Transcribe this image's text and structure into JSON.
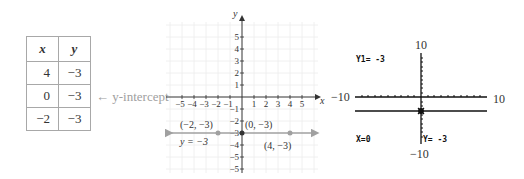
{
  "table": {
    "headers": [
      "x",
      "y"
    ],
    "rows": [
      {
        "x": "4",
        "y": "−3"
      },
      {
        "x": "0",
        "y": "−3"
      },
      {
        "x": "−2",
        "y": "−3"
      }
    ],
    "annotation": "← y-intercept"
  },
  "graph": {
    "x_axis_label": "x",
    "y_axis_label": "y",
    "x_ticks": [
      "−5",
      "−4",
      "−3",
      "−2",
      "−1",
      "1",
      "2",
      "3",
      "4",
      "5"
    ],
    "y_ticks": [
      "5",
      "4",
      "3",
      "2",
      "1",
      "−1",
      "−2",
      "−3",
      "−4",
      "−5"
    ],
    "line_label": "y = −3",
    "points": [
      {
        "label": "(−2, −3)",
        "x": -2,
        "y": -3
      },
      {
        "label": "(0, −3)",
        "x": 0,
        "y": -3
      },
      {
        "label": "(4, −3)",
        "x": 4,
        "y": -3
      }
    ],
    "line_color": "#a0a0a0",
    "point_color": "#a0a0a0",
    "intercept_color": "#333333"
  },
  "calculator": {
    "top_left": "Y1= -3",
    "bottom_left": "X=0",
    "bottom_right": "Y= -3",
    "window": {
      "xmin": "−10",
      "xmax": "10",
      "ymin": "−10",
      "ymax": "10"
    },
    "screen_bg": "#e4e4e4"
  }
}
